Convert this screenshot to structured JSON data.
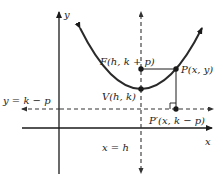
{
  "diagram": {
    "colors": {
      "background": "#ffffff",
      "axes": "#1a1a1a",
      "curve": "#2a2a2a",
      "dashed": "#333333",
      "text": "#222222"
    },
    "axes": {
      "x_label": "x",
      "y_label": "y"
    },
    "labels": {
      "focus": "F(h, k + p)",
      "point": "P(x, y)",
      "vertex": "V(h, k)",
      "projection": "P′(x, k − p)",
      "directrix": "y = k − p",
      "axis_of_symmetry": "x = h"
    },
    "points": [
      {
        "name": "F",
        "x": 141,
        "y": 69
      },
      {
        "name": "V",
        "x": 141,
        "y": 89
      },
      {
        "name": "P",
        "x": 176,
        "y": 69
      },
      {
        "name": "P'",
        "x": 176,
        "y": 109
      }
    ]
  }
}
